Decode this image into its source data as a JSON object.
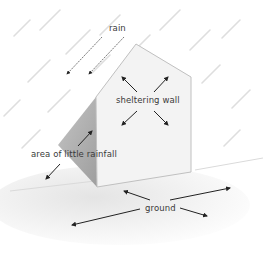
{
  "diagram": {
    "labels": {
      "rain": "rain",
      "sheltering_wall": "sheltering wall",
      "area_of_little_rainfall": "area of little rainfall",
      "ground": "ground"
    },
    "colors": {
      "background": "#ffffff",
      "wall_face": "#f2f2f2",
      "wall_edge": "#bdbdbd",
      "shadow_side": "#b9b9b9",
      "ground": "#ececec",
      "rain_streak": "#dcdcdc",
      "arrow": "#222222",
      "text": "#3a3a3a"
    }
  }
}
